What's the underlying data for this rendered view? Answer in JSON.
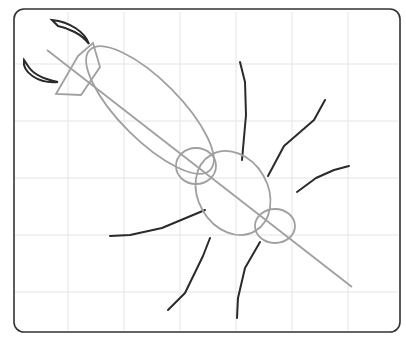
{
  "drawing": {
    "subject": "insect sketch on grid",
    "frame": {
      "x": 13,
      "y": 8,
      "w": 388,
      "h": 324,
      "rx": 10,
      "stroke": "#333333"
    },
    "grid": {
      "xs": [
        68,
        124,
        180,
        236,
        292,
        348
      ],
      "ys": [
        64,
        121,
        178,
        235,
        292
      ],
      "color": "#e4e4e4"
    },
    "colors": {
      "guide": "#a0a0a0",
      "leg": "#2a2a2a",
      "mandible": "#2a2a2a"
    }
  }
}
